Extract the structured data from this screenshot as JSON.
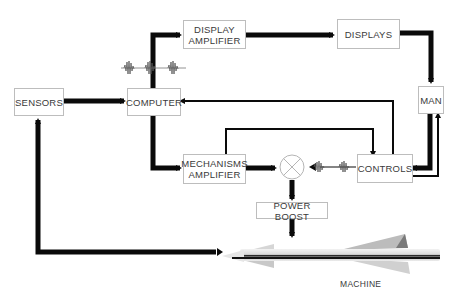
{
  "diagram": {
    "blocks": {
      "sensors": "SENSORS",
      "computer": "COMPUTER",
      "display_amplifier_line1": "DISPLAY",
      "display_amplifier_line2": "AMPLIFIER",
      "displays": "DISPLAYS",
      "man": "MAN",
      "mechanisms_amplifier_line1": "MECHANISMS",
      "mechanisms_amplifier_line2": "AMPLIFIER",
      "controls": "CONTROLS",
      "power_boost": "POWER BOOST"
    },
    "machine_label": "MACHINE",
    "colors": {
      "line": "#0a0a0a",
      "box_border": "#bdbdbd",
      "text": "#3a3a3a"
    }
  }
}
